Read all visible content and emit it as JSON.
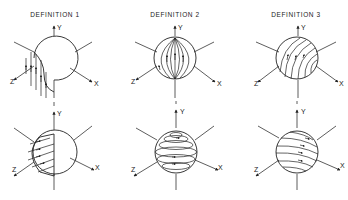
{
  "figure": {
    "panels": [
      {
        "title": "DEFINITION 1",
        "cx": 54,
        "field_type": "half-sphere-vertical-lines"
      },
      {
        "title": "DEFINITION 2",
        "cx": 175,
        "field_type": "meridians-to-pole"
      },
      {
        "title": "DEFINITION 3",
        "cx": 296,
        "field_type": "tilted-meridians"
      }
    ],
    "rows": [
      {
        "cy": 58,
        "description": "flow lines along Y direction"
      },
      {
        "cy": 152,
        "description": "flow lines around Y axis (latitude circles)"
      }
    ],
    "axes": {
      "x": "X",
      "y": "Y",
      "z": "Z"
    },
    "colors": {
      "line": "#222222",
      "background": "#ffffff"
    }
  }
}
